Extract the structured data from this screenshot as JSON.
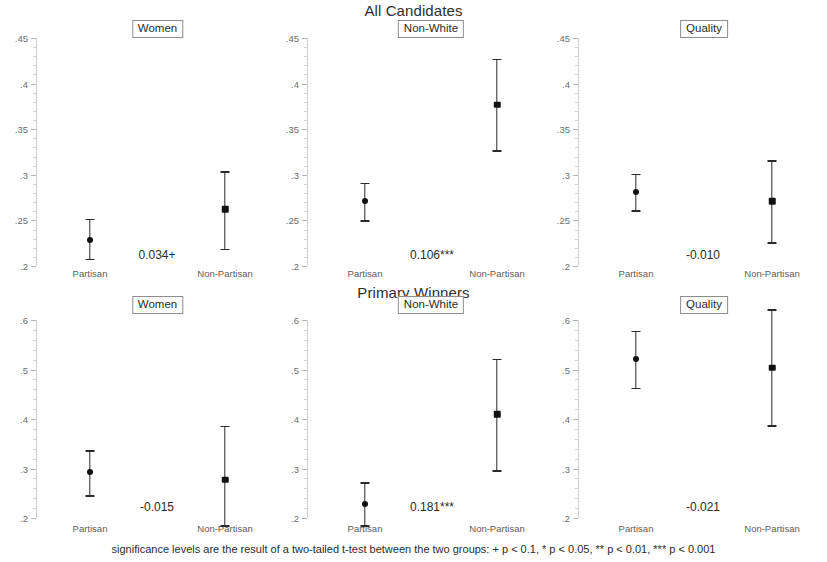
{
  "figure": {
    "row_titles": [
      "All Candidates",
      "Primary Winners"
    ],
    "footnote": "significance levels are the result of a two-tailed t-test between the two groups: + p < 0.1, * p < 0.05, ** p < 0.01, *** p < 0.001",
    "categories": [
      "Partisan",
      "Non-Partisan"
    ]
  },
  "chart_data": {
    "type": "scatter",
    "subtitle": "",
    "xlabel": "",
    "ylabel": "",
    "grid": false,
    "legend": "none",
    "panels": [
      {
        "row": "All Candidates",
        "label": "Women",
        "ylim": [
          0.2,
          0.45
        ],
        "yticks": [
          0.2,
          0.25,
          0.3,
          0.35,
          0.4,
          0.45
        ],
        "ytick_labels": [
          ".2",
          ".25",
          ".3",
          ".35",
          ".4",
          ".45"
        ],
        "categories": [
          "Partisan",
          "Non-Partisan"
        ],
        "values": [
          0.229,
          0.262
        ],
        "ci_low": [
          0.208,
          0.219
        ],
        "ci_high": [
          0.252,
          0.304
        ],
        "marker": [
          "circle",
          "square"
        ],
        "difference": "0.034+"
      },
      {
        "row": "All Candidates",
        "label": "Non-White",
        "ylim": [
          0.2,
          0.45
        ],
        "yticks": [
          0.2,
          0.25,
          0.3,
          0.35,
          0.4,
          0.45
        ],
        "ytick_labels": [
          ".2",
          ".25",
          ".3",
          ".35",
          ".4",
          ".45"
        ],
        "categories": [
          "Partisan",
          "Non-Partisan"
        ],
        "values": [
          0.271,
          0.377
        ],
        "ci_low": [
          0.25,
          0.327
        ],
        "ci_high": [
          0.291,
          0.427
        ],
        "marker": [
          "circle",
          "square"
        ],
        "difference": "0.106***"
      },
      {
        "row": "All Candidates",
        "label": "Quality",
        "ylim": [
          0.2,
          0.45
        ],
        "yticks": [
          0.2,
          0.25,
          0.3,
          0.35,
          0.4,
          0.45
        ],
        "ytick_labels": [
          ".2",
          ".25",
          ".3",
          ".35",
          ".4",
          ".45"
        ],
        "categories": [
          "Partisan",
          "Non-Partisan"
        ],
        "values": [
          0.281,
          0.271
        ],
        "ci_low": [
          0.261,
          0.226
        ],
        "ci_high": [
          0.301,
          0.316
        ],
        "marker": [
          "circle",
          "square"
        ],
        "difference": "-0.010"
      },
      {
        "row": "Primary Winners",
        "label": "Women",
        "ylim": [
          0.2,
          0.6
        ],
        "yticks": [
          0.2,
          0.3,
          0.4,
          0.5,
          0.6
        ],
        "ytick_labels": [
          ".2",
          ".3",
          ".4",
          ".5",
          ".6"
        ],
        "categories": [
          "Partisan",
          "Non-Partisan"
        ],
        "values": [
          0.292,
          0.277
        ],
        "ci_low": [
          0.246,
          0.185
        ],
        "ci_high": [
          0.337,
          0.386
        ],
        "marker": [
          "circle",
          "square"
        ],
        "difference": "-0.015"
      },
      {
        "row": "Primary Winners",
        "label": "Non-White",
        "ylim": [
          0.2,
          0.6
        ],
        "yticks": [
          0.2,
          0.3,
          0.4,
          0.5,
          0.6
        ],
        "ytick_labels": [
          ".2",
          ".3",
          ".4",
          ".5",
          ".6"
        ],
        "categories": [
          "Partisan",
          "Non-Partisan"
        ],
        "values": [
          0.229,
          0.41
        ],
        "ci_low": [
          0.185,
          0.296
        ],
        "ci_high": [
          0.272,
          0.521
        ],
        "marker": [
          "circle",
          "square"
        ],
        "difference": "0.181***"
      },
      {
        "row": "Primary Winners",
        "label": "Quality",
        "ylim": [
          0.2,
          0.6
        ],
        "yticks": [
          0.2,
          0.3,
          0.4,
          0.5,
          0.6
        ],
        "ytick_labels": [
          ".2",
          ".3",
          ".4",
          ".5",
          ".6"
        ],
        "categories": [
          "Partisan",
          "Non-Partisan"
        ],
        "values": [
          0.521,
          0.504
        ],
        "ci_low": [
          0.463,
          0.387
        ],
        "ci_high": [
          0.578,
          0.622
        ],
        "marker": [
          "circle",
          "square"
        ],
        "difference": "-0.021"
      }
    ],
    "colors": {
      "marker": "#111111",
      "error_bar": "#2a2a2a",
      "axis": "#cfcfcf",
      "text": "#2b2b2b"
    }
  }
}
